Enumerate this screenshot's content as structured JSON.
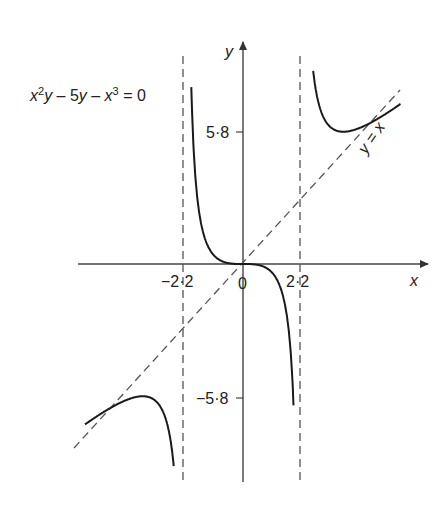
{
  "diagram": {
    "equation_label": {
      "x2": "x",
      "sup2": "2",
      "y1": "y",
      "mid": " – 5",
      "y2": "y",
      "minus": " – ",
      "x3": "x",
      "sup3": "3",
      "eq": " = 0"
    },
    "axis_labels": {
      "x": "x",
      "y": "y"
    },
    "ticks": {
      "x_neg": "−2·2",
      "x_zero": "0",
      "x_pos": "2·2",
      "y_pos": "5·8",
      "y_neg": "−5·8"
    },
    "asymptote_label": "y = x",
    "colors": {
      "curve": "#1a1a1a",
      "axis": "#444444",
      "dashed": "#555555",
      "text": "#222222"
    }
  },
  "chart_data": {
    "type": "line",
    "function": "y = x^3 / (x^2 - 5)",
    "xlabel": "x",
    "ylabel": "y",
    "vertical_asymptotes": [
      -2.2,
      2.2
    ],
    "oblique_asymptote": "y = x",
    "tick_labels": {
      "x": [
        "-2.2",
        "0",
        "2.2"
      ],
      "y": [
        "5.8",
        "-5.8"
      ]
    },
    "turning_points": [
      {
        "x": 3.87,
        "y": 5.8
      },
      {
        "x": -3.87,
        "y": -5.8
      },
      {
        "x": 0,
        "y": 0
      }
    ],
    "grid": false
  }
}
